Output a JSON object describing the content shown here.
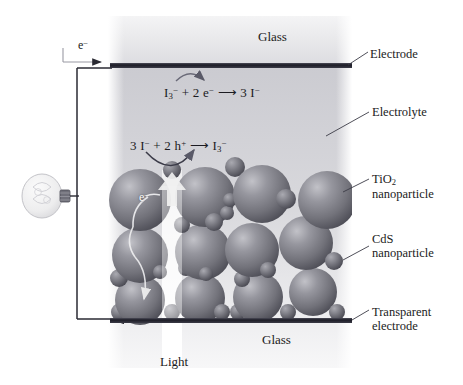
{
  "diagram": {
    "labels": {
      "glass_top": "Glass",
      "glass_bottom": "Glass",
      "light": "Light",
      "electrode": "Electrode",
      "electrolyte": "Electrolyte",
      "tio2_line1": "TiO",
      "tio2_sub": "2",
      "tio2_line2": "nanoparticle",
      "cds_line1": "CdS",
      "cds_line2": "nanoparticle",
      "transparent_line1": "Transparent",
      "transparent_line2": "electrode"
    },
    "equations": {
      "cathode": {
        "reactant_1": "I",
        "reactant_1_sub": "3",
        "reactant_1_sup": "−",
        "plus": "+",
        "reactant_2": "2 e",
        "reactant_2_sup": "−",
        "arrow": "⟶",
        "product": "3 I",
        "product_sup": "−",
        "full_text": "I3− + 2 e− ⟶ 3 I−"
      },
      "anode": {
        "reactant_1": "3 I",
        "reactant_1_sup": "−",
        "plus": "+",
        "reactant_2": "2 h",
        "reactant_2_sup": "+",
        "arrow": "⟶",
        "product": "I",
        "product_sub": "3",
        "product_sup": "−",
        "full_text": "3 I− + 2 h+ ⟶ I3−"
      }
    },
    "annotations": {
      "electron_circuit": "e",
      "electron_circuit_sup": "−",
      "electron_particle": "e",
      "electron_particle_sup": "−"
    },
    "colors": {
      "sphere_fill": "#7d7d85",
      "sphere_highlight": "#b9b9c0",
      "sphere_shadow": "#4a4a52",
      "small_sphere_fill": "#6e6e77",
      "electrode_bar": "#242430",
      "glass_top_bg": "#e8e8ea",
      "electrolyte_bg": "#d2d2d6",
      "wire": "#2a2a33",
      "text": "#1b1b22",
      "light_beam": "#ffffff",
      "bulb_glass": "#efefef"
    },
    "geometry": {
      "cell_left": 108,
      "cell_right": 352,
      "top_electrode_y": 64,
      "bottom_electrode_y": 319,
      "light_beam_x": 172
    },
    "spheres": {
      "large": [
        {
          "cx": 140,
          "cy": 200,
          "r": 31
        },
        {
          "cx": 205,
          "cy": 197,
          "r": 30
        },
        {
          "cx": 262,
          "cy": 194,
          "r": 29
        },
        {
          "cx": 327,
          "cy": 200,
          "r": 29
        },
        {
          "cx": 140,
          "cy": 255,
          "r": 28
        },
        {
          "cx": 203,
          "cy": 252,
          "r": 28
        },
        {
          "cx": 252,
          "cy": 250,
          "r": 27
        },
        {
          "cx": 306,
          "cy": 243,
          "r": 27
        },
        {
          "cx": 140,
          "cy": 300,
          "r": 25
        },
        {
          "cx": 200,
          "cy": 298,
          "r": 25
        },
        {
          "cx": 258,
          "cy": 297,
          "r": 25
        },
        {
          "cx": 313,
          "cy": 292,
          "r": 24
        }
      ],
      "small": [
        {
          "cx": 172,
          "cy": 170,
          "r": 9
        },
        {
          "cx": 235,
          "cy": 167,
          "r": 10
        },
        {
          "cx": 286,
          "cy": 199,
          "r": 10
        },
        {
          "cx": 182,
          "cy": 225,
          "r": 8
        },
        {
          "cx": 214,
          "cy": 222,
          "r": 9
        },
        {
          "cx": 227,
          "cy": 213,
          "r": 7
        },
        {
          "cx": 230,
          "cy": 200,
          "r": 7
        },
        {
          "cx": 268,
          "cy": 270,
          "r": 8
        },
        {
          "cx": 186,
          "cy": 268,
          "r": 8
        },
        {
          "cx": 160,
          "cy": 272,
          "r": 7
        },
        {
          "cx": 206,
          "cy": 274,
          "r": 7
        },
        {
          "cx": 242,
          "cy": 279,
          "r": 8
        },
        {
          "cx": 334,
          "cy": 261,
          "r": 9
        },
        {
          "cx": 119,
          "cy": 278,
          "r": 9
        },
        {
          "cx": 120,
          "cy": 312,
          "r": 9
        },
        {
          "cx": 172,
          "cy": 312,
          "r": 8
        },
        {
          "cx": 222,
          "cy": 312,
          "r": 8
        },
        {
          "cx": 238,
          "cy": 312,
          "r": 8
        },
        {
          "cx": 288,
          "cy": 312,
          "r": 8
        },
        {
          "cx": 337,
          "cy": 312,
          "r": 8
        }
      ]
    }
  }
}
